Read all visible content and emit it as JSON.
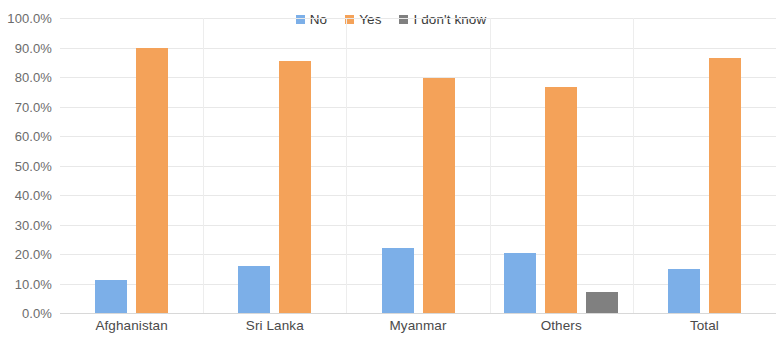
{
  "chart_data": {
    "type": "bar",
    "title": "",
    "xlabel": "",
    "ylabel": "",
    "ylim": [
      0,
      100
    ],
    "grid": true,
    "legend_position": "top-center",
    "categories": [
      "Afghanistan",
      "Sri Lanka",
      "Myanmar",
      "Others",
      "Total"
    ],
    "tick_labels": [
      "100.0%",
      "90.0%",
      "80.0%",
      "70.0%",
      "60.0%",
      "50.0%",
      "40.0%",
      "30.0%",
      "20.0%",
      "10.0%",
      "0.0%"
    ],
    "tick_values": [
      100,
      90,
      80,
      70,
      60,
      50,
      40,
      30,
      20,
      10,
      0
    ],
    "series": [
      {
        "name": "No",
        "color": "#7CAFE8",
        "values": [
          11.3,
          16.0,
          22.0,
          20.2,
          14.8
        ]
      },
      {
        "name": "Yes",
        "color": "#F4A259",
        "values": [
          89.8,
          85.5,
          79.8,
          76.5,
          86.3
        ]
      },
      {
        "name": "I don't know",
        "color": "#808080",
        "values": [
          0,
          0,
          0,
          7.0,
          0
        ]
      }
    ]
  }
}
